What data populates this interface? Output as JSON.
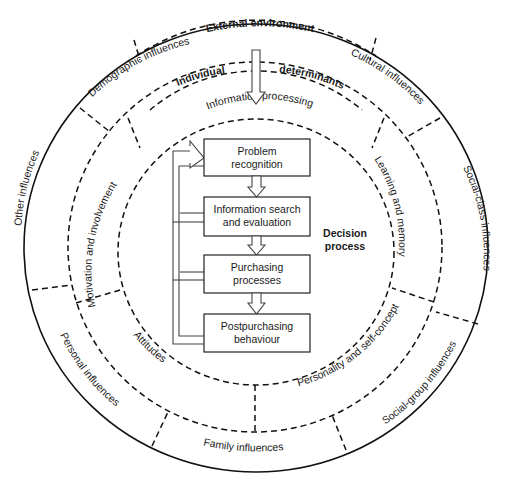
{
  "outer_ring": {
    "top_label": "External environment",
    "segments": [
      {
        "id": "demographic",
        "label": "Demographic influences"
      },
      {
        "id": "cultural",
        "label": "Cultural influences"
      },
      {
        "id": "social-class",
        "label": "Social-class influences"
      },
      {
        "id": "social-group",
        "label": "Social-group influences"
      },
      {
        "id": "family",
        "label": "Family influences"
      },
      {
        "id": "personal",
        "label": "Personal influences"
      },
      {
        "id": "other",
        "label": "Other influences"
      }
    ]
  },
  "middle_ring": {
    "title_left": "Individual",
    "title_right": "determinants",
    "segments": [
      {
        "id": "information-processing",
        "label": "Information processing"
      },
      {
        "id": "learning-memory",
        "label": "Learning and memory"
      },
      {
        "id": "personality",
        "label": "Personality and self-concept"
      },
      {
        "id": "attitudes",
        "label": "Attitudes"
      },
      {
        "id": "motivation",
        "label": "Motivation and involvement"
      }
    ]
  },
  "decision_process": {
    "title_line1": "Decision",
    "title_line2": "process",
    "steps": [
      {
        "line1": "Problem",
        "line2": "recognition"
      },
      {
        "line1": "Information search",
        "line2": "and evaluation"
      },
      {
        "line1": "Purchasing",
        "line2": "processes"
      },
      {
        "line1": "Postpurchasing",
        "line2": "behaviour"
      }
    ]
  }
}
